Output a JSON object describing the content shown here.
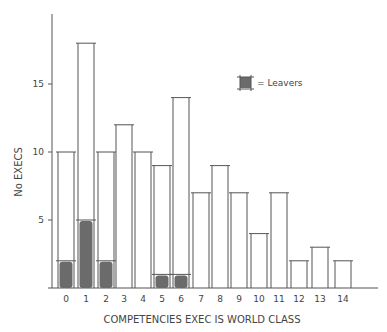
{
  "chart_data": {
    "type": "bar",
    "title": "",
    "xlabel": "COMPETENCIES EXEC IS WORLD CLASS",
    "ylabel": "No EXECS",
    "categories": [
      "0",
      "1",
      "2",
      "3",
      "4",
      "5",
      "6",
      "7",
      "8",
      "9",
      "10",
      "11",
      "12",
      "13",
      "14"
    ],
    "series": [
      {
        "name": "No Execs",
        "values": [
          10,
          18,
          10,
          12,
          10,
          9,
          14,
          7,
          9,
          7,
          4,
          7,
          2,
          3,
          2
        ],
        "style": "outline"
      },
      {
        "name": "Leavers",
        "values": [
          2,
          5,
          2,
          0,
          0,
          1,
          1,
          0,
          0,
          0,
          0,
          0,
          0,
          0,
          0
        ],
        "style": "filled",
        "color": "#6b6b6b"
      }
    ],
    "ylim": [
      0,
      20
    ],
    "yticks": [
      5,
      10,
      15
    ],
    "grid": false,
    "legend": {
      "position": "upper-right",
      "entries": [
        {
          "label": "= Leavers",
          "color": "#6b6b6b"
        }
      ]
    }
  },
  "colors": {
    "ink": "#555555",
    "leaver_fill": "#6b6b6b"
  }
}
